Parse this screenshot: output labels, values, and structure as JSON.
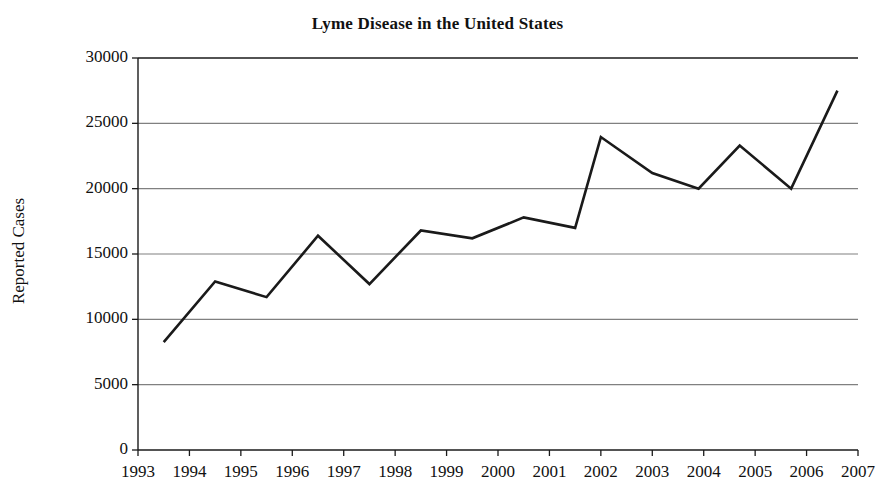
{
  "chart_data": {
    "type": "line",
    "title": "Lyme Disease in the United States",
    "xlabel": "",
    "ylabel": "Reported Cases",
    "x": [
      1993.5,
      1994.5,
      1995.5,
      1996.5,
      1997.5,
      1998.5,
      1999.5,
      2000.5,
      2001.5,
      2002.5,
      2003.5,
      2004.5,
      2005.5,
      2006.5
    ],
    "categories": [
      "1993",
      "1994",
      "1995",
      "1996",
      "1997",
      "1998",
      "1999",
      "2000",
      "2001",
      "2002",
      "2003",
      "2004",
      "2005",
      "2006",
      "2007"
    ],
    "values": [
      8250,
      12900,
      11700,
      16400,
      12700,
      16800,
      16200,
      17800,
      17000,
      23950,
      21200,
      20000,
      23300,
      20000,
      27500
    ],
    "series": [
      {
        "name": "Reported Cases",
        "points": [
          {
            "year": 1993.5,
            "value": 8250
          },
          {
            "year": 1994.5,
            "value": 12900
          },
          {
            "year": 1995.5,
            "value": 11700
          },
          {
            "year": 1996.5,
            "value": 16400
          },
          {
            "year": 1997.5,
            "value": 12700
          },
          {
            "year": 1998.5,
            "value": 16800
          },
          {
            "year": 1999.5,
            "value": 16200
          },
          {
            "year": 2000.5,
            "value": 17800
          },
          {
            "year": 2001.5,
            "value": 17000
          },
          {
            "year": 2002.0,
            "value": 23950
          },
          {
            "year": 2003.0,
            "value": 21200
          },
          {
            "year": 2003.9,
            "value": 20000
          },
          {
            "year": 2004.7,
            "value": 23300
          },
          {
            "year": 2005.7,
            "value": 20000
          },
          {
            "year": 2006.6,
            "value": 27500
          }
        ]
      }
    ],
    "xlim": [
      1993,
      2007
    ],
    "ylim": [
      0,
      30000
    ],
    "ytick_labels": [
      "30000",
      "25000",
      "20000",
      "15000",
      "10000",
      "5000",
      "0"
    ],
    "ytick_values": [
      30000,
      25000,
      20000,
      15000,
      10000,
      5000,
      0
    ],
    "xtick_labels": [
      "1993",
      "1994",
      "1995",
      "1996",
      "1997",
      "1998",
      "1999",
      "2000",
      "2001",
      "2002",
      "2003",
      "2004",
      "2005",
      "2006",
      "2007"
    ],
    "grid": "horizontal",
    "legend": "none",
    "line_color": "#1a1a1a",
    "grid_color": "#808080",
    "axis_color": "#1a1a1a",
    "background": "#ffffff"
  }
}
